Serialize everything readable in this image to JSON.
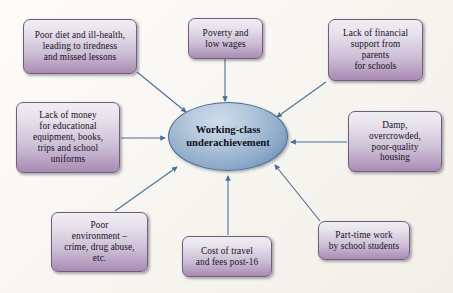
{
  "diagram": {
    "center": {
      "id": "center-node",
      "label": "Working-class underachievement",
      "lines": [
        "Working-class",
        "underachievement"
      ],
      "shape": "ellipse",
      "fill_color": "#92aecb",
      "border_color": "#4a678c"
    },
    "arrow_color": "#4a6f99",
    "box_fill_top": "#efeef3",
    "box_fill_bottom": "#a98bb4",
    "box_border_color": "#6f5f7a",
    "background_color": "#fbfaf7",
    "nodes": [
      {
        "id": "poor-diet",
        "label": "Poor diet and ill-health, leading to tiredness and missed lessons",
        "lines": [
          "Poor diet and ill-health,",
          "leading to tiredness",
          "and missed lessons"
        ]
      },
      {
        "id": "poverty-low-wages",
        "label": "Poverty and low wages",
        "lines": [
          "Poverty and",
          "low wages"
        ]
      },
      {
        "id": "lack-financial-support",
        "label": "Lack of financial support from parents for schools",
        "lines": [
          "Lack of financial",
          "support from",
          "parents",
          "for schools"
        ]
      },
      {
        "id": "lack-of-money",
        "label": "Lack of money for educational equipment, books, trips and school uniforms",
        "lines": [
          "Lack of money",
          "for educational",
          "equipment, books,",
          "trips and school",
          "uniforms"
        ]
      },
      {
        "id": "damp-housing",
        "label": "Damp, overcrowded, poor-quality housing",
        "lines": [
          "Damp,",
          "overcrowded,",
          "poor-quality",
          "housing"
        ]
      },
      {
        "id": "poor-environment",
        "label": "Poor environment – crime, drug abuse, etc.",
        "lines": [
          "Poor",
          "environment –",
          "crime, drug abuse,",
          "etc."
        ]
      },
      {
        "id": "cost-of-travel",
        "label": "Cost of travel and fees post-16",
        "lines": [
          "Cost of travel",
          "and fees post-16"
        ]
      },
      {
        "id": "part-time-work",
        "label": "Part-time work by school students",
        "lines": [
          "Part-time work",
          "by school students"
        ]
      }
    ]
  }
}
